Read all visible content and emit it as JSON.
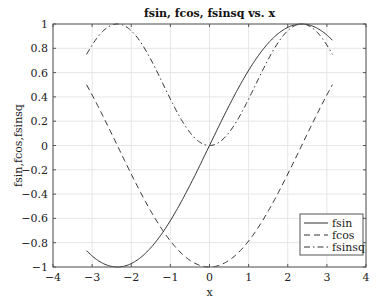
{
  "chart_data": {
    "type": "line",
    "title": "fsin, fcos, fsinsq vs. x",
    "xlabel": "x",
    "ylabel": "fsin,fcos,fsinsq",
    "xlim": [
      -4,
      4
    ],
    "ylim": [
      -1,
      1
    ],
    "grid": true,
    "legend_position": "lower right",
    "xticks": [
      -4,
      -3,
      -2,
      -1,
      0,
      1,
      2,
      3,
      4
    ],
    "xtick_labels": [
      "−4",
      "−3",
      "−2",
      "−1",
      "0",
      "1",
      "2",
      "3",
      "4"
    ],
    "yticks": [
      -1,
      -0.8,
      -0.6,
      -0.4,
      -0.2,
      0,
      0.2,
      0.4,
      0.6,
      0.8,
      1
    ],
    "ytick_labels": [
      "−1",
      "−0.8",
      "−0.6",
      "−0.4",
      "−0.2",
      "0",
      "0.2",
      "0.4",
      "0.6",
      "0.8",
      "1"
    ],
    "x": [
      -3.1416,
      -2.7489,
      -2.3562,
      -1.9635,
      -1.5708,
      -1.1781,
      -0.7854,
      -0.3927,
      0,
      0.3927,
      0.7854,
      1.1781,
      1.5708,
      1.9635,
      2.3562,
      2.7489,
      3.1416
    ],
    "series": [
      {
        "name": "fsin",
        "style": "solid",
        "values": [
          -0.866,
          -0.966,
          -1.0,
          -0.966,
          -0.866,
          -0.707,
          -0.5,
          -0.259,
          0.0,
          0.259,
          0.5,
          0.707,
          0.866,
          0.966,
          1.0,
          0.966,
          0.866
        ]
      },
      {
        "name": "fcos",
        "style": "dashed",
        "values": [
          0.5,
          0.259,
          0.0,
          -0.259,
          -0.5,
          -0.707,
          -0.866,
          -0.966,
          -1.0,
          -0.966,
          -0.866,
          -0.707,
          -0.5,
          -0.259,
          0.0,
          0.259,
          0.5
        ]
      },
      {
        "name": "fsinsq",
        "style": "dashdot",
        "values": [
          0.75,
          0.933,
          1.0,
          0.933,
          0.75,
          0.5,
          0.25,
          0.067,
          0.0,
          0.067,
          0.25,
          0.5,
          0.75,
          0.933,
          1.0,
          0.933,
          0.75
        ]
      }
    ]
  },
  "legend": {
    "items": [
      {
        "label": "fsin",
        "style": "solid"
      },
      {
        "label": "fcos",
        "style": "dashed"
      },
      {
        "label": "fsinsq",
        "style": "dashdot"
      }
    ]
  },
  "colors": {
    "line": "#333333",
    "grid": "#e6e6e6",
    "axes": "#555555"
  }
}
